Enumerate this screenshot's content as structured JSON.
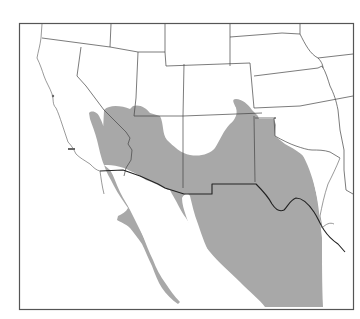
{
  "map": {
    "type": "species-range-map",
    "region": "Southwestern United States and Northern Mexico",
    "colors": {
      "range_fill": "#a8a8a8",
      "background": "#ffffff",
      "border": "#444444",
      "frame": "#555555"
    },
    "legend": null,
    "labels": []
  }
}
